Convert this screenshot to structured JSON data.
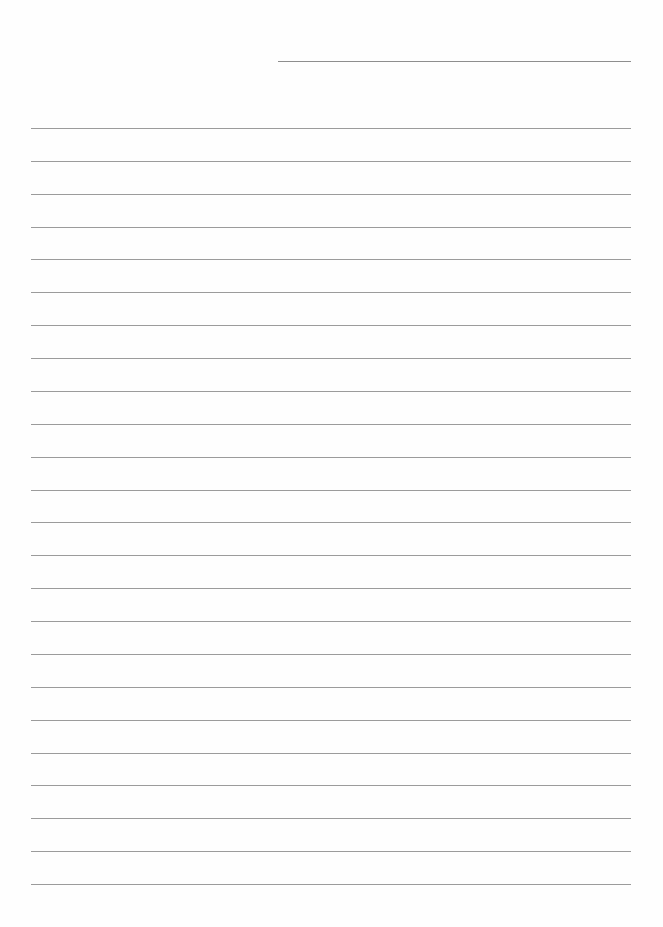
{
  "page": {
    "type": "lined-writing-paper",
    "background": "#fefefe",
    "line_color": "#8a8a8a",
    "header_line": {
      "x1": 278,
      "x2": 631,
      "y": 61
    },
    "ruled_lines": {
      "count": 24,
      "first_y": 128,
      "spacing": 32.87,
      "x1": 31,
      "x2": 631
    }
  }
}
